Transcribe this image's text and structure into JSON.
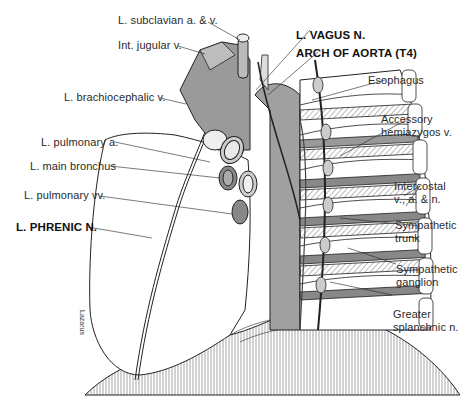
{
  "figure": {
    "signature": "Lazarus"
  },
  "labels_left": [
    {
      "id": "l-subclavian",
      "text": "L. subclavian a. & v.",
      "bold": false
    },
    {
      "id": "int-jugular",
      "text": "Int. jugular v.",
      "bold": false
    },
    {
      "id": "l-brachiocephalic",
      "text": "L. brachiocephalic v.",
      "bold": false
    },
    {
      "id": "l-pulmonary-a",
      "text": "L. pulmonary a.",
      "bold": false
    },
    {
      "id": "l-main-bronchus",
      "text": "L. main bronchus",
      "bold": false
    },
    {
      "id": "l-pulmonary-vv",
      "text": "L. pulmonary vv.",
      "bold": false
    },
    {
      "id": "l-phrenic",
      "text": "L. PHRENIC N.",
      "bold": true
    }
  ],
  "labels_top": [
    {
      "id": "l-vagus",
      "text": "L. VAGUS N.",
      "bold": true
    },
    {
      "id": "arch-aorta",
      "text": "ARCH OF AORTA (T4)",
      "bold": true
    }
  ],
  "labels_right": [
    {
      "id": "esophagus",
      "text": "Esophagus"
    },
    {
      "id": "accessory-hemiazygos",
      "line1": "Accessory",
      "line2": "hemiazygos v."
    },
    {
      "id": "intercostal",
      "line1": "Intercostal",
      "line2": "v., a. & n."
    },
    {
      "id": "sympathetic-trunk",
      "line1": "Sympathetic",
      "line2": "trunk"
    },
    {
      "id": "sympathetic-ganglion",
      "line1": "Sympathetic",
      "line2": "ganglion"
    },
    {
      "id": "greater-splanchnic",
      "line1": "Greater",
      "line2": "splanchnic n."
    }
  ],
  "colors": {
    "ink": "#222222",
    "vessel_dark": "#8a8a8a",
    "vessel_mid": "#a8a8a8",
    "vessel_light": "#c4c4c4",
    "aorta": "#9c9c9c",
    "background": "#ffffff"
  }
}
